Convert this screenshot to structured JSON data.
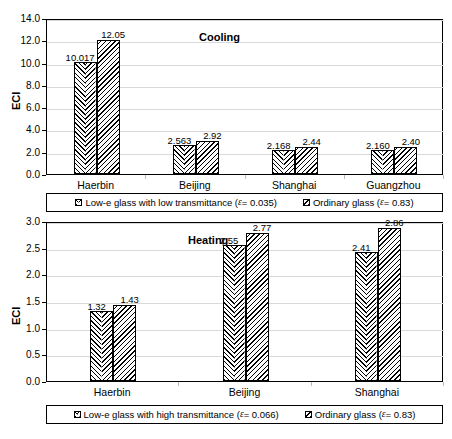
{
  "chart_data": [
    {
      "type": "bar",
      "title": "Cooling",
      "xlabel": "",
      "ylabel": "ECI",
      "categories": [
        "Haerbin",
        "Beijing",
        "Shanghai",
        "Guangzhou"
      ],
      "ylim": [
        0.0,
        14.0
      ],
      "yticks": [
        "0.0",
        "2.0",
        "4.0",
        "6.0",
        "8.0",
        "10.0",
        "12.0",
        "14.0"
      ],
      "grid": true,
      "legend_position": "below",
      "series": [
        {
          "name": "Low-e glass with low transmittance (ε = 0.035)",
          "name_prefix": "Low-e glass with low transmittance (",
          "name_symbol": "ε",
          "name_suffix": " = 0.035)",
          "pattern": "chevron",
          "values": [
            10.017,
            2.563,
            2.168,
            2.16
          ],
          "labels": [
            "10.017",
            "2.563",
            "2.168",
            "2.160"
          ]
        },
        {
          "name": "Ordinary glass (ε = 0.83)",
          "name_prefix": "Ordinary glass (",
          "name_symbol": "ε",
          "name_suffix": " = 0.83)",
          "pattern": "diagonal",
          "values": [
            12.05,
            2.92,
            2.44,
            2.4
          ],
          "labels": [
            "12.05",
            "2.92",
            "2.44",
            "2.40"
          ]
        }
      ]
    },
    {
      "type": "bar",
      "title": "Heating",
      "xlabel": "",
      "ylabel": "ECI",
      "categories": [
        "Haerbin",
        "Beijing",
        "Shanghai"
      ],
      "ylim": [
        0.0,
        3.0
      ],
      "yticks": [
        "0.0",
        "0.5",
        "1.0",
        "1.5",
        "2.0",
        "2.5",
        "3.0"
      ],
      "grid": true,
      "legend_position": "below",
      "series": [
        {
          "name": "Low-e glass with high transmittance (ε = 0.066)",
          "name_prefix": "Low-e glass with high transmittance (",
          "name_symbol": "ε",
          "name_suffix": " = 0.066)",
          "pattern": "chevron",
          "values": [
            1.32,
            2.55,
            2.41
          ],
          "labels": [
            "1.32",
            "2.55",
            "2.41"
          ]
        },
        {
          "name": "Ordinary glass (ε = 0.83)",
          "name_prefix": "Ordinary glass (",
          "name_symbol": "ε",
          "name_suffix": " = 0.83)",
          "pattern": "diagonal",
          "values": [
            1.43,
            2.77,
            2.86
          ],
          "labels": [
            "1.43",
            "2.77",
            "2.86"
          ]
        }
      ]
    }
  ],
  "colors": {
    "axis": "#000000",
    "grid": "#d9d9d9",
    "text": "#000000",
    "background": "#ffffff"
  }
}
